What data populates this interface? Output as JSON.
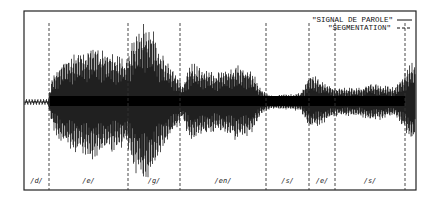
{
  "chart_data": {
    "type": "line",
    "title": "",
    "xlabel": "",
    "ylabel": "",
    "grid": false,
    "legend_position": "top-right",
    "legend": [
      {
        "label": "\"SIGNAL DE PAROLE\"",
        "style": "solid"
      },
      {
        "label": "\"SEGMENTATION\"",
        "style": "dashed"
      }
    ],
    "frame": {
      "x0": 24,
      "y0": 11,
      "x1": 416,
      "y1": 190,
      "center_y": 102
    },
    "segment_boundaries_px": [
      49,
      128,
      180,
      266,
      309,
      335,
      405
    ],
    "segments": [
      {
        "label": "/d/",
        "x_start": 24,
        "x_end": 49
      },
      {
        "label": "/e/",
        "x_start": 49,
        "x_end": 128
      },
      {
        "label": "/g/",
        "x_start": 128,
        "x_end": 180
      },
      {
        "label": "/en/",
        "x_start": 180,
        "x_end": 266
      },
      {
        "label": "/s/",
        "x_start": 266,
        "x_end": 309
      },
      {
        "label": "/e/",
        "x_start": 309,
        "x_end": 335
      },
      {
        "label": "/s/",
        "x_start": 335,
        "x_end": 405
      }
    ],
    "signal_envelope": [
      {
        "x": 24,
        "amp": 3
      },
      {
        "x": 48,
        "amp": 3
      },
      {
        "x": 52,
        "amp": 25
      },
      {
        "x": 60,
        "amp": 42
      },
      {
        "x": 80,
        "amp": 55
      },
      {
        "x": 95,
        "amp": 58
      },
      {
        "x": 110,
        "amp": 52
      },
      {
        "x": 125,
        "amp": 45
      },
      {
        "x": 135,
        "amp": 70
      },
      {
        "x": 142,
        "amp": 85
      },
      {
        "x": 150,
        "amp": 80
      },
      {
        "x": 160,
        "amp": 55
      },
      {
        "x": 175,
        "amp": 30
      },
      {
        "x": 182,
        "amp": 18
      },
      {
        "x": 190,
        "amp": 40
      },
      {
        "x": 205,
        "amp": 35
      },
      {
        "x": 215,
        "amp": 30
      },
      {
        "x": 235,
        "amp": 38
      },
      {
        "x": 250,
        "amp": 35
      },
      {
        "x": 262,
        "amp": 12
      },
      {
        "x": 270,
        "amp": 7
      },
      {
        "x": 300,
        "amp": 9
      },
      {
        "x": 310,
        "amp": 28
      },
      {
        "x": 318,
        "amp": 25
      },
      {
        "x": 335,
        "amp": 15
      },
      {
        "x": 360,
        "amp": 15
      },
      {
        "x": 370,
        "amp": 20
      },
      {
        "x": 395,
        "amp": 15
      },
      {
        "x": 402,
        "amp": 25
      },
      {
        "x": 410,
        "amp": 40
      },
      {
        "x": 416,
        "amp": 40
      }
    ]
  }
}
